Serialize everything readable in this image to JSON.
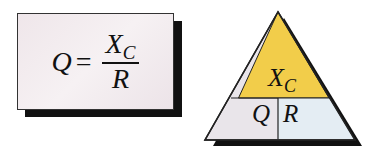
{
  "formula": {
    "lhs": "Q",
    "equals": "=",
    "numerator": "X",
    "numerator_sub": "C",
    "denominator": "R"
  },
  "triangle": {
    "top_label": "X",
    "top_label_sub": "C",
    "bottom_left_label": "Q",
    "bottom_right_label": "R",
    "colors": {
      "top": "#f2cd4a",
      "bottom_left": "#e9e5ea",
      "bottom_right": "#e4edf3",
      "shadow": "#111111"
    }
  }
}
